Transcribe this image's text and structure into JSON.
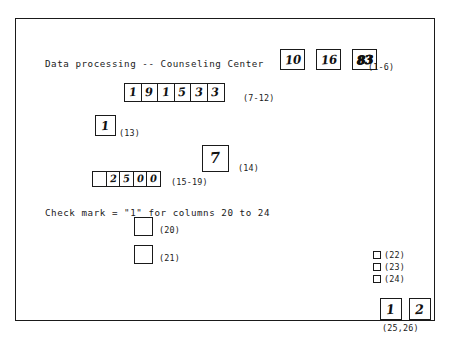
{
  "document": {
    "title_line": "Data processing -- Counseling Center",
    "checkmark_note": "Check mark = \"1\" for columns 20 to 24",
    "border_color": "#1a1a1a",
    "ink_color": "#111111",
    "paper_color": "#ffffff"
  },
  "fields": [
    {
      "id": "cols-1-6",
      "caption": "(1-6)",
      "layout": "separated",
      "boxes": [
        {
          "value": "10",
          "emphasis": false
        },
        {
          "value": "16",
          "emphasis": false
        },
        {
          "value": "83",
          "emphasis": true
        }
      ]
    },
    {
      "id": "cols-7-12",
      "caption": "(7-12)",
      "layout": "joined",
      "boxes": [
        {
          "value": "1"
        },
        {
          "value": "9"
        },
        {
          "value": "1"
        },
        {
          "value": "5"
        },
        {
          "value": "3"
        },
        {
          "value": "3"
        }
      ]
    },
    {
      "id": "col-13",
      "caption": "(13)",
      "layout": "single",
      "boxes": [
        {
          "value": "1"
        }
      ]
    },
    {
      "id": "col-14",
      "caption": "(14)",
      "layout": "single",
      "boxes": [
        {
          "value": "7"
        }
      ]
    },
    {
      "id": "cols-15-19",
      "caption": "(15-19)",
      "layout": "joined",
      "boxes": [
        {
          "value": ""
        },
        {
          "value": "2"
        },
        {
          "value": "5"
        },
        {
          "value": "0"
        },
        {
          "value": "0"
        }
      ]
    },
    {
      "id": "col-20",
      "caption": "(20)",
      "layout": "single",
      "boxes": [
        {
          "value": ""
        }
      ]
    },
    {
      "id": "col-21",
      "caption": "(21)",
      "layout": "single",
      "boxes": [
        {
          "value": ""
        }
      ]
    },
    {
      "id": "col-22",
      "caption": "(22)",
      "layout": "tiny-check",
      "checked": false
    },
    {
      "id": "col-23",
      "caption": "(23)",
      "layout": "tiny-check",
      "checked": false
    },
    {
      "id": "col-24",
      "caption": "(24)",
      "layout": "tiny-check",
      "checked": false
    },
    {
      "id": "cols-25-26",
      "caption": "(25,26)",
      "layout": "separated",
      "boxes": [
        {
          "value": "1"
        },
        {
          "value": "2"
        }
      ]
    }
  ]
}
